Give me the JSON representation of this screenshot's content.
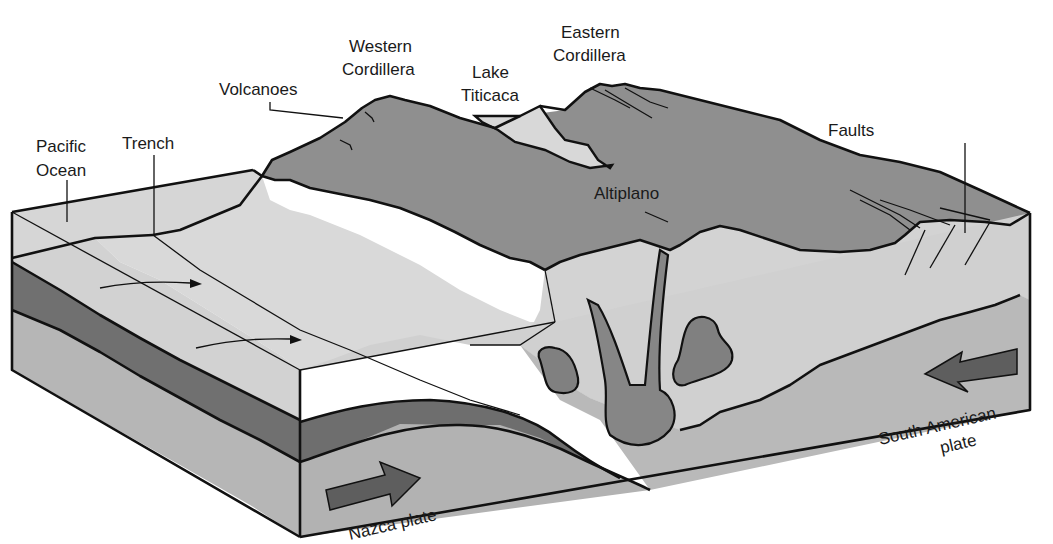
{
  "diagram": {
    "type": "geologic block diagram",
    "labels": {
      "pacific_ocean": [
        "Pacific",
        "Ocean"
      ],
      "trench": "Trench",
      "volcanoes": "Volcanoes",
      "western_cordillera": [
        "Western",
        "Cordillera"
      ],
      "lake_titicaca": [
        "Lake",
        "Titicaca"
      ],
      "eastern_cordillera": [
        "Eastern",
        "Cordillera"
      ],
      "altiplano": "Altiplano",
      "faults": "Faults",
      "south_american_plate": [
        "South American",
        "plate"
      ],
      "nazca_plate": "Nazca plate"
    },
    "colors": {
      "ocean_surface": "#d4d4d4",
      "continental_crust_light": "#cfcfcf",
      "highland_dark": "#8e8e8e",
      "oceanic_slab": "#6f6f6f",
      "mantle": "#b4b4b4",
      "magma": "#858585",
      "arrow": "#5e5e5e",
      "outline": "#111111"
    }
  }
}
